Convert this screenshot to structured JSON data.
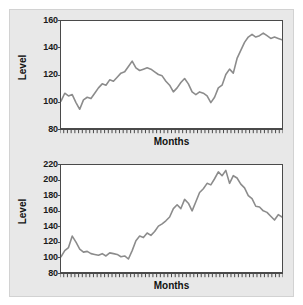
{
  "figure": {
    "background_color": "#ffffff",
    "card_color": "#e8e8e8",
    "line_color": "#8c8c8c",
    "axis_color": "#4a4a4a"
  },
  "chart_data": [
    {
      "id": "top-chart",
      "type": "line",
      "title": "",
      "xlabel": "Months",
      "ylabel": "Level",
      "ylim": [
        80,
        160
      ],
      "yticks": [
        80,
        100,
        120,
        140,
        160
      ],
      "xlim": [
        0,
        59
      ],
      "xticklabels": [],
      "grid": false,
      "legend": false,
      "n_minor_xticks": 60,
      "series": [
        {
          "name": "Level",
          "color": "#8c8c8c",
          "x": [
            0,
            1,
            2,
            3,
            4,
            5,
            6,
            7,
            8,
            9,
            10,
            11,
            12,
            13,
            14,
            15,
            16,
            17,
            18,
            19,
            20,
            21,
            22,
            23,
            24,
            25,
            26,
            27,
            28,
            29,
            30,
            31,
            32,
            33,
            34,
            35,
            36,
            37,
            38,
            39,
            40,
            41,
            42,
            43,
            44,
            45,
            46,
            47,
            48,
            49,
            50,
            51,
            52,
            53,
            54,
            55,
            56,
            57,
            58,
            59
          ],
          "values": [
            100,
            106,
            104,
            105,
            99,
            94,
            101,
            103,
            102,
            106,
            110,
            113,
            112,
            116,
            115,
            118,
            121,
            122,
            126,
            130,
            125,
            123,
            124,
            125,
            124,
            122,
            120,
            119,
            115,
            112,
            107,
            110,
            114,
            117,
            113,
            107,
            105,
            107,
            106,
            104,
            99,
            103,
            110,
            112,
            120,
            124,
            121,
            132,
            138,
            144,
            148,
            150,
            148,
            149,
            151,
            149,
            147,
            148,
            147,
            146
          ]
        }
      ]
    },
    {
      "id": "bottom-chart",
      "type": "line",
      "title": "",
      "xlabel": "Months",
      "ylabel": "Level",
      "ylim": [
        80,
        220
      ],
      "yticks": [
        80,
        100,
        120,
        140,
        160,
        180,
        200,
        220
      ],
      "xlim": [
        0,
        59
      ],
      "xticklabels": [],
      "grid": false,
      "legend": false,
      "n_minor_xticks": 60,
      "series": [
        {
          "name": "Level",
          "color": "#8c8c8c",
          "x": [
            0,
            1,
            2,
            3,
            4,
            5,
            6,
            7,
            8,
            9,
            10,
            11,
            12,
            13,
            14,
            15,
            16,
            17,
            18,
            19,
            20,
            21,
            22,
            23,
            24,
            25,
            26,
            27,
            28,
            29,
            30,
            31,
            32,
            33,
            34,
            35,
            36,
            37,
            38,
            39,
            40,
            41,
            42,
            43,
            44,
            45,
            46,
            47,
            48,
            49,
            50,
            51,
            52,
            53,
            54,
            55,
            56,
            57,
            58,
            59
          ],
          "values": [
            100,
            108,
            112,
            127,
            119,
            110,
            106,
            107,
            104,
            103,
            102,
            104,
            101,
            105,
            104,
            103,
            100,
            101,
            97,
            108,
            121,
            127,
            125,
            131,
            128,
            133,
            140,
            143,
            147,
            152,
            163,
            168,
            163,
            175,
            170,
            160,
            172,
            184,
            189,
            196,
            194,
            202,
            211,
            206,
            213,
            196,
            206,
            203,
            195,
            190,
            180,
            176,
            166,
            165,
            160,
            158,
            153,
            148,
            155,
            152
          ]
        }
      ]
    }
  ],
  "panels": [
    {
      "ylabel": "Level",
      "xlabel": "Months",
      "ytick_labels": [
        "160",
        "140",
        "120",
        "100",
        "80"
      ]
    },
    {
      "ylabel": "Level",
      "xlabel": "Months",
      "ytick_labels": [
        "220",
        "200",
        "180",
        "160",
        "140",
        "120",
        "100",
        "80"
      ]
    }
  ]
}
